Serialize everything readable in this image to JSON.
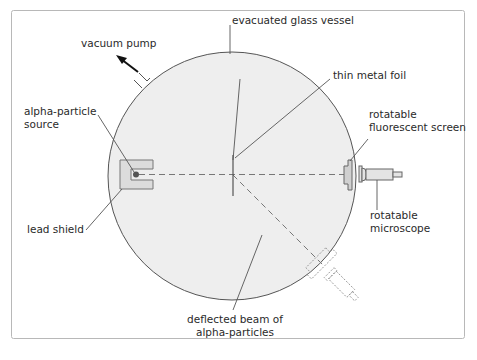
{
  "diagram": {
    "type": "apparatus",
    "colors": {
      "frame": "#b8b8b8",
      "vessel_fill": "#eeeeee",
      "vessel_stroke": "#555555",
      "line": "#444444",
      "component_fill": "#d8d8d8",
      "beam": "#666666"
    },
    "labels": {
      "vessel": "evacuated glass vessel",
      "vacuum_pump": "vacuum pump",
      "source_line1": "alpha-particle",
      "source_line2": "source",
      "foil": "thin metal foil",
      "screen_line1": "rotatable",
      "screen_line2": "fluorescent screen",
      "microscope_line1": "rotatable",
      "microscope_line2": "microscope",
      "shield": "lead shield",
      "deflected_line1": "deflected beam of",
      "deflected_line2": "alpha-particles"
    }
  }
}
